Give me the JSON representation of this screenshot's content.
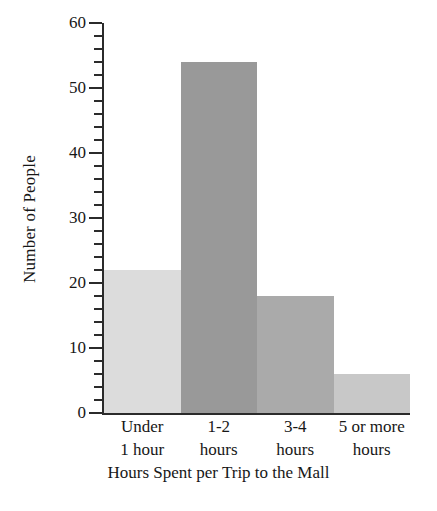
{
  "chart_data": {
    "type": "bar",
    "title": "",
    "xlabel": "Hours Spent per Trip to the Mall",
    "ylabel": "Number of People",
    "categories": [
      "Under 1 hour",
      "1-2 hours",
      "3-4 hours",
      "5 or more hours"
    ],
    "category_lines": [
      [
        "Under",
        "1 hour"
      ],
      [
        "1-2",
        "hours"
      ],
      [
        "3-4",
        "hours"
      ],
      [
        "5 or more",
        "hours"
      ]
    ],
    "values": [
      22,
      54,
      18,
      6
    ],
    "bar_colors": [
      "#dcdcdc",
      "#999999",
      "#aaaaaa",
      "#c8c8c8"
    ],
    "ylim": [
      0,
      60
    ],
    "y_major_ticks": [
      0,
      10,
      20,
      30,
      40,
      50,
      60
    ],
    "y_tick_labels": [
      "0",
      "10",
      "20",
      "30",
      "40",
      "50",
      "60"
    ],
    "y_minor_tick_interval": 2,
    "grid": false,
    "legend": "none",
    "bars_adjacent": true,
    "axis_color": "#2b2b2b"
  }
}
